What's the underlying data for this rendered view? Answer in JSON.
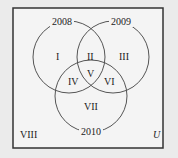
{
  "diagram": {
    "type": "venn",
    "universe_label": "U",
    "sets": [
      {
        "label": "2008"
      },
      {
        "label": "2009"
      },
      {
        "label": "2010"
      }
    ],
    "regions": [
      "I",
      "II",
      "III",
      "IV",
      "V",
      "VI",
      "VII",
      "VIII"
    ],
    "colors": {
      "background": "#ebebeb",
      "frame": "#333333",
      "circle": "#555555",
      "inner": "#f4f4f4"
    }
  }
}
